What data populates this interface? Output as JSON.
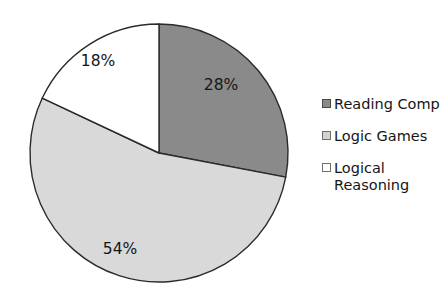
{
  "chart_data": {
    "type": "pie",
    "title": "",
    "categories": [
      "Reading Comp",
      "Logic Games",
      "Logical Reasoning"
    ],
    "values": [
      28,
      54,
      18
    ],
    "value_labels": [
      "28%",
      "54%",
      "18%"
    ],
    "units": "percent",
    "start_angle_deg": 0,
    "direction": "clockwise",
    "legend_position": "right",
    "grid": false,
    "slice_colors": [
      "#8a8a8a",
      "#d9d9d9",
      "#ffffff"
    ],
    "slice_border_color": "#2b2b2b",
    "background_color": "#ffffff",
    "label_color": "#161616"
  },
  "chart": {
    "center_x": 159,
    "center_y": 153,
    "radius": 129,
    "slices": [
      {
        "name": "Reading Comp",
        "value": 28,
        "label": "28%",
        "color": "#8a8a8a",
        "label_x": 221,
        "label_y": 90
      },
      {
        "name": "Logic Games",
        "value": 54,
        "label": "54%",
        "color": "#d9d9d9",
        "label_x": 120,
        "label_y": 254
      },
      {
        "name": "Logical Reasoning",
        "value": 18,
        "label": "18%",
        "color": "#ffffff",
        "label_x": 98,
        "label_y": 66
      }
    ]
  },
  "legend": {
    "entries": [
      {
        "label": "Reading Comp",
        "color": "#8a8a8a",
        "border": "#4a4a4a"
      },
      {
        "label": "Logic Games",
        "color": "#d2d2d2",
        "border": "#6f6f6f"
      },
      {
        "label": "Logical\nReasoning",
        "color": "#ffffff",
        "border": "#6f6f6f"
      }
    ]
  }
}
